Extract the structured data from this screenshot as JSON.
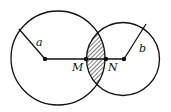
{
  "diagram": {
    "type": "two intersecting circles with shaded lens",
    "colors": {
      "stroke": "#111111",
      "background": "#ffffff",
      "hatch": "#111111"
    },
    "large_circle": {
      "cx": 58,
      "cy": 58,
      "r": 47,
      "radius_label": "a",
      "center_dot": {
        "x": 45,
        "y": 59
      },
      "radius_end": {
        "x": 19,
        "y": 29
      }
    },
    "small_circle": {
      "cx": 123,
      "cy": 59,
      "r": 36.5,
      "radius_label": "b",
      "center_dot": {
        "x": 124,
        "y": 59
      },
      "radius_end": {
        "x": 146,
        "y": 24
      }
    },
    "points": [
      {
        "label": "M",
        "x": 86,
        "y": 59
      },
      {
        "label": "N",
        "x": 106,
        "y": 59
      }
    ],
    "labels": {
      "a": "a",
      "b": "b",
      "M": "M",
      "N": "N"
    },
    "shaded_region": "intersection (lens) of the two circles, hatched"
  }
}
